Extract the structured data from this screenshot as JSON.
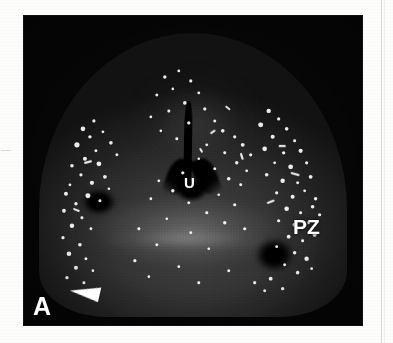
{
  "figure": {
    "panel_label": "A",
    "annotations": [
      {
        "id": "urethra",
        "text": "U",
        "meaning": "urethra"
      },
      {
        "id": "peripheral-zone",
        "text": "PZ",
        "meaning": "peripheral zone"
      }
    ],
    "marker": {
      "id": "arrowhead-marker",
      "glyph": "◀",
      "color": "#ffffff"
    },
    "colors": {
      "page_background": "#fdfdfc",
      "plate_background": "#050505",
      "tissue_mid": "#3b3b3b",
      "label_color": "#ffffff",
      "column_rule": "#d9d8d4"
    }
  }
}
